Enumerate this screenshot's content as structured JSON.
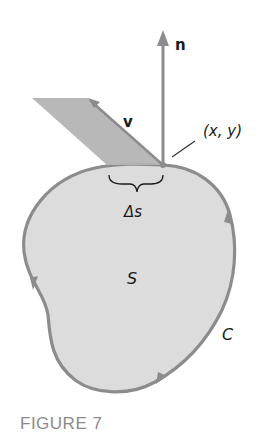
{
  "figure": {
    "caption": "FIGURE 7",
    "labels": {
      "normal_vector": "n",
      "velocity_vector": "v",
      "point": "(x, y)",
      "arc_length": "Δs",
      "region": "S",
      "curve": "C"
    },
    "colors": {
      "region_fill": "#dcdcdc",
      "curve_stroke": "#8c8c8c",
      "parallelogram_fill": "#b4b4b4",
      "arrow": "#8c8c8c",
      "text": "#1a1a1a",
      "caption": "#8a8a8a"
    },
    "elements": [
      "region S bounded by closed curve C (counterclockwise orientation arrows)",
      "unit normal vector n pointing up from point (x, y)",
      "vector field v at (x, y) forming parallelogram with arc Δs",
      "brace marking arc segment Δs"
    ]
  }
}
